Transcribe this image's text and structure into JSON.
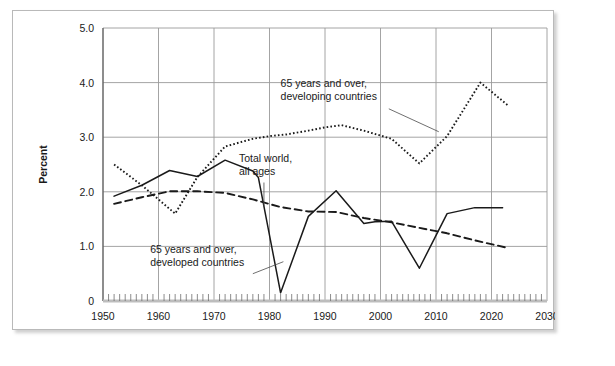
{
  "figure": {
    "faint_header_text": "",
    "background_color": "#ffffff",
    "frame_border_color": "#b9b9b9"
  },
  "chart_data": {
    "type": "line",
    "title": "",
    "xlabel": "Year",
    "ylabel": "Percent",
    "xlim": [
      1950,
      2030
    ],
    "ylim": [
      0,
      5
    ],
    "xticks": [
      1950,
      1960,
      1970,
      1980,
      1990,
      2000,
      2010,
      2020,
      2030
    ],
    "xtick_labels": [
      "1950",
      "1960",
      "1970",
      "1980",
      "1990",
      "2000",
      "2010",
      "2020",
      "2030"
    ],
    "yticks": [
      0,
      1,
      2,
      3,
      4,
      5
    ],
    "ytick_labels": [
      "0",
      "1.0",
      "2.0",
      "3.0",
      "4.0",
      "5.0"
    ],
    "minor_xtick_interval": 1,
    "grid": "horizontal-and-vertical-at-decade-ticks",
    "grid_color": "#9a9a9a",
    "legend": "inline-annotations",
    "series": [
      {
        "name": "65 years and over, developing countries",
        "style": "dotted",
        "color": "#1a1a1a",
        "x": [
          1952,
          1957,
          1963,
          1967,
          1972,
          1977,
          1980,
          1983,
          1987,
          1990,
          1993,
          1997,
          2002,
          2007,
          2012,
          2018,
          2023
        ],
        "y": [
          2.5,
          2.12,
          1.6,
          2.27,
          2.83,
          2.97,
          3.02,
          3.05,
          3.12,
          3.18,
          3.22,
          3.12,
          2.97,
          2.52,
          3.02,
          4.0,
          3.58
        ]
      },
      {
        "name": "65 years and over, developed countries",
        "style": "solid",
        "color": "#1a1a1a",
        "x": [
          1952,
          1957,
          1962,
          1967,
          1972,
          1977,
          1978,
          1982,
          1987,
          1992,
          1997,
          1999,
          2002,
          2007,
          2012,
          2017,
          2022
        ],
        "y": [
          1.92,
          2.12,
          2.39,
          2.28,
          2.58,
          2.38,
          2.26,
          0.15,
          1.55,
          2.02,
          1.42,
          1.45,
          1.46,
          0.6,
          1.6,
          1.71,
          1.71
        ]
      },
      {
        "name": "Total world, all ages",
        "style": "dashed",
        "color": "#1a1a1a",
        "x": [
          1952,
          1957,
          1962,
          1967,
          1972,
          1977,
          1982,
          1987,
          1992,
          1997,
          2002,
          2007,
          2012,
          2017,
          2023
        ],
        "y": [
          1.78,
          1.9,
          2.01,
          2.01,
          1.98,
          1.86,
          1.72,
          1.64,
          1.63,
          1.52,
          1.44,
          1.34,
          1.24,
          1.11,
          0.97
        ]
      }
    ],
    "annotations": [
      {
        "id": "annot-developing",
        "lines": [
          "65 years and over,",
          "developing countries"
        ],
        "text_x": 1982.0,
        "text_y": 3.92,
        "leader_from": [
          2001.5,
          3.52
        ],
        "leader_to": [
          2010.5,
          3.1
        ]
      },
      {
        "id": "annot-total-world",
        "lines": [
          "Total world,",
          "all ages"
        ],
        "text_x": 1974.5,
        "text_y": 2.55,
        "leader_from": [
          1979.0,
          2.17
        ],
        "leader_to": [
          1979.0,
          1.73
        ]
      },
      {
        "id": "annot-developed",
        "lines": [
          "65 years and over,",
          "developed countries"
        ],
        "text_x": 1958.5,
        "text_y": 0.88,
        "leader_from": [
          1977.0,
          0.5
        ],
        "leader_to": [
          1982.5,
          0.72
        ]
      }
    ]
  }
}
